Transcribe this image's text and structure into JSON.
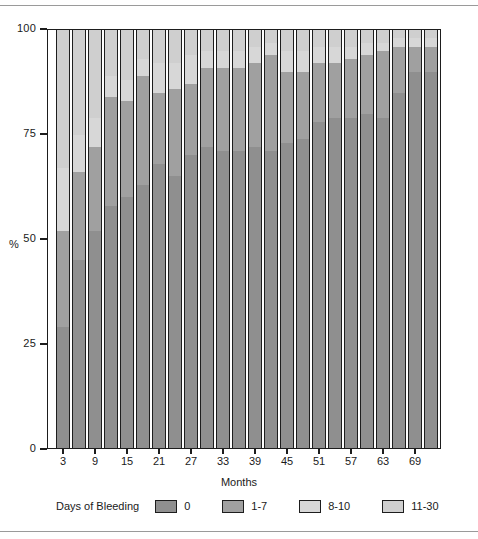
{
  "figure": {
    "y_axis_title": "%",
    "x_axis_title": "Months",
    "legend_title": "Days of Bleeding"
  },
  "chart_data": {
    "type": "bar",
    "subtype": "stacked-percentage",
    "title": "",
    "xlabel": "Months",
    "ylabel": "%",
    "ylim": [
      0,
      100
    ],
    "yticks": [
      0,
      25,
      50,
      75,
      100
    ],
    "ytick_labels": [
      "0",
      "25",
      "50",
      "75",
      "100"
    ],
    "grid": false,
    "legend_position": "below-axis",
    "legend_title": "Days of Bleeding",
    "categories": [
      3,
      6,
      9,
      12,
      15,
      18,
      21,
      24,
      27,
      30,
      33,
      36,
      39,
      42,
      45,
      48,
      51,
      54,
      57,
      60,
      63,
      66,
      69,
      72
    ],
    "xtick_labels": [
      "3",
      "9",
      "15",
      "21",
      "27",
      "33",
      "39",
      "45",
      "51",
      "57",
      "63",
      "69"
    ],
    "xtick_positions": [
      3,
      9,
      15,
      21,
      27,
      33,
      39,
      45,
      51,
      57,
      63,
      69
    ],
    "series": [
      {
        "name": "0",
        "color": "#8f8f8f",
        "values": [
          29,
          45,
          52,
          58,
          60,
          63,
          68,
          65,
          70,
          72,
          71,
          71,
          72,
          71,
          73,
          74,
          78,
          79,
          79,
          80,
          79,
          85,
          90,
          90
        ]
      },
      {
        "name": "1-7",
        "color": "#a0a0a0",
        "values": [
          23,
          21,
          20,
          26,
          23,
          26,
          17,
          21,
          17,
          19,
          20,
          20,
          20,
          23,
          17,
          16,
          14,
          13,
          14,
          14,
          16,
          11,
          6,
          6
        ]
      },
      {
        "name": "8-10",
        "color": "#d7d7d7",
        "values": [
          15,
          9,
          7,
          5,
          5,
          4,
          7,
          6,
          7,
          4,
          4,
          4,
          4,
          3,
          5,
          5,
          4,
          4,
          3,
          3,
          2,
          2,
          2,
          2
        ]
      },
      {
        "name": "11-30",
        "color": "#cfcfcf",
        "values": [
          33,
          25,
          21,
          11,
          12,
          7,
          8,
          8,
          6,
          5,
          5,
          5,
          4,
          3,
          5,
          5,
          4,
          4,
          4,
          3,
          3,
          2,
          2,
          2
        ]
      }
    ],
    "segment_order_bottom_to_top": [
      "0",
      "1-7",
      "8-10",
      "11-30"
    ],
    "palette": {
      "0": "#8f8f8f",
      "1-7": "#a0a0a0",
      "8-10": "#d7d7d7",
      "11-30": "#cfcfcf",
      "axis": "#1d1d1d",
      "rule": "#9a9a9a"
    }
  },
  "legend": {
    "items": [
      {
        "label": "0",
        "color": "#8f8f8f"
      },
      {
        "label": "1-7",
        "color": "#a0a0a0"
      },
      {
        "label": "8-10",
        "color": "#d7d7d7"
      },
      {
        "label": "11-30",
        "color": "#cfcfcf"
      }
    ]
  }
}
